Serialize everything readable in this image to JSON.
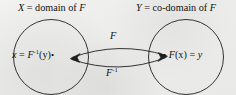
{
  "diagram": {
    "type": "function-inverse-mapping",
    "background_color": "#efefed",
    "stroke_color": "#1a1a1a",
    "headers": {
      "left": {
        "variable": "X",
        "equals": " = ",
        "text": "domain of ",
        "function": "F",
        "full": "X = domain of F"
      },
      "right": {
        "variable": "Y",
        "equals": " = ",
        "text": "co-domain of ",
        "function": "F",
        "full": "Y = co-domain of F"
      }
    },
    "nodes": {
      "left": {
        "variable": "x",
        "equals": " = ",
        "function": "F",
        "exponent": "-1",
        "argument": "(y)",
        "bullet": "•",
        "full": "x = F⁻¹(y) •"
      },
      "right": {
        "bullet": "•",
        "function": "F",
        "argument": "(x)",
        "equals": " = ",
        "variable": "y",
        "full": "• F(x) = y"
      }
    },
    "arrows": {
      "forward": {
        "label": "F",
        "exponent": "",
        "direction": "left-to-right",
        "position": "top"
      },
      "inverse": {
        "label": "F",
        "exponent": "-1",
        "direction": "right-to-left",
        "position": "bottom"
      }
    },
    "circles": {
      "left": {
        "cx": 51,
        "cy": 57,
        "r": 38
      },
      "right": {
        "cx": 186,
        "cy": 57,
        "r": 38
      }
    }
  }
}
